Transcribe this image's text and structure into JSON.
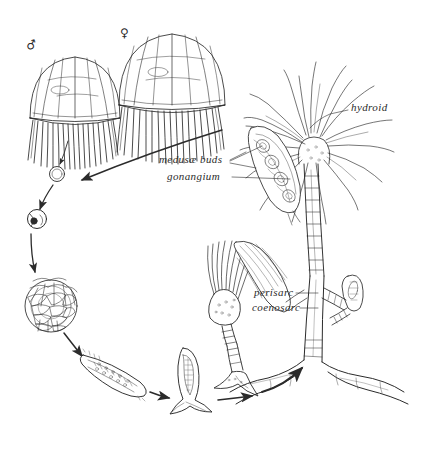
{
  "figure": {
    "background_color": "#ffffff",
    "ink_color": "#2b2b2b",
    "width": 425,
    "height": 450
  },
  "symbols": {
    "male": "♂",
    "female": "♀"
  },
  "labels": {
    "hydroid": "hydroid",
    "medusae_buds": "medusæ buds",
    "gonangium": "gonangium",
    "perisarc": "perisarc",
    "coenosarc": "coenosarc"
  },
  "stages": [
    {
      "name": "male-medusa",
      "label": "♂"
    },
    {
      "name": "female-medusa",
      "label": "♀"
    },
    {
      "name": "fertilized-egg",
      "label": ""
    },
    {
      "name": "two-cell-stage",
      "label": ""
    },
    {
      "name": "blastula",
      "label": ""
    },
    {
      "name": "planula-larva",
      "label": ""
    },
    {
      "name": "settled-planula",
      "label": ""
    },
    {
      "name": "young-polyp",
      "label": ""
    },
    {
      "name": "hydroid-colony",
      "label": ""
    }
  ]
}
